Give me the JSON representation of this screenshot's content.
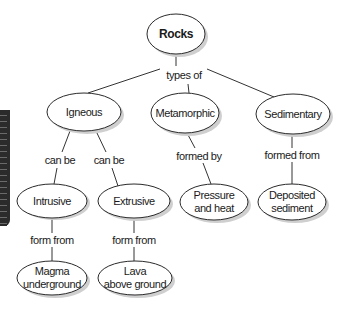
{
  "diagram": {
    "type": "concept-map",
    "root": {
      "label": "Rocks"
    },
    "root_connector": "types of",
    "categories": [
      {
        "label": "Igneous",
        "connectors": [
          "can be",
          "can be"
        ]
      },
      {
        "label": "Metamorphic",
        "connector": "formed by"
      },
      {
        "label": "Sedimentary",
        "connector": "formed from"
      }
    ],
    "subtypes": [
      {
        "label": "Intrusive",
        "connector": "form from",
        "source": "Magma underground"
      },
      {
        "label": "Extrusive",
        "connector": "form from",
        "source": "Lava above ground"
      }
    ],
    "leaves": {
      "metamorphic": {
        "line1": "Pressure",
        "line2": "and heat"
      },
      "sedimentary": {
        "line1": "Deposited",
        "line2": "sediment"
      },
      "intrusive": {
        "line1": "Magma",
        "line2": "underground"
      },
      "extrusive": {
        "line1": "Lava",
        "line2": "above ground"
      }
    }
  },
  "side_tab": {
    "color": "#2b2b2b"
  }
}
